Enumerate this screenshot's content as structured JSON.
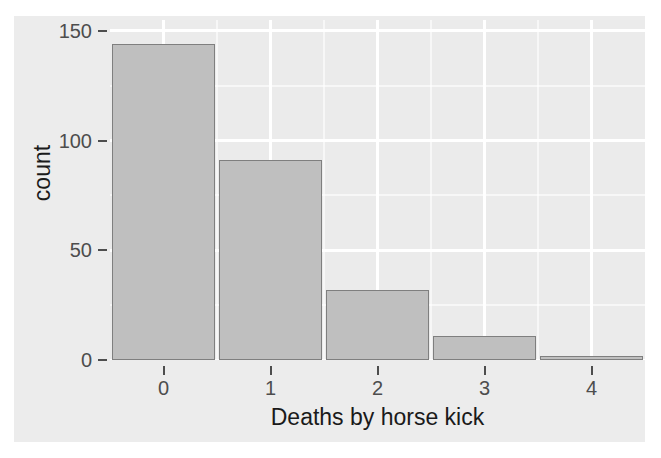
{
  "chart_data": {
    "type": "bar",
    "title": "",
    "subtitle": "",
    "xlabel": "Deaths by horse kick",
    "ylabel": "count",
    "categories": [
      "0",
      "1",
      "2",
      "3",
      "4"
    ],
    "values": [
      144,
      91,
      32,
      11,
      2
    ],
    "series": [
      {
        "name": "count",
        "values": [
          144,
          91,
          32,
          11,
          2
        ]
      }
    ],
    "xlim": [
      -0.5,
      4.5
    ],
    "ylim": [
      0,
      155
    ],
    "x_ticks": [
      "0",
      "1",
      "2",
      "3",
      "4"
    ],
    "y_ticks": [
      "0",
      "50",
      "100",
      "150"
    ],
    "y_tick_values": [
      0,
      50,
      100,
      150
    ],
    "y_minor_tick_values": [
      25,
      75,
      125
    ],
    "grid": true,
    "grid_color": "#ffffff",
    "legend": "none",
    "bar_fill_color": "#bfbfbf",
    "bar_border_color": "#7f7f7f",
    "panel_background_color": "#ebebeb",
    "plot_background_color": "#ececec",
    "axis_text_color": "#4d4d4d",
    "axis_title_color": "#1a1a1a"
  },
  "axes": {
    "y": {
      "title": "count",
      "ticks": [
        {
          "label": "150",
          "value": 150
        },
        {
          "label": "100",
          "value": 100
        },
        {
          "label": "50",
          "value": 50
        },
        {
          "label": "0",
          "value": 0
        }
      ]
    },
    "x": {
      "title": "Deaths by horse kick",
      "ticks": [
        {
          "label": "0",
          "value": 0
        },
        {
          "label": "1",
          "value": 1
        },
        {
          "label": "2",
          "value": 2
        },
        {
          "label": "3",
          "value": 3
        },
        {
          "label": "4",
          "value": 4
        }
      ]
    }
  }
}
